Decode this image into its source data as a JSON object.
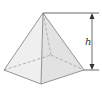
{
  "diagram": {
    "type": "square-pyramid",
    "height_label": "h",
    "colors": {
      "edge": "#8a8a8a",
      "hidden_edge": "#9a9a9a",
      "face_left": "#ececec",
      "face_right": "#dedede",
      "dimension_line": "#444444"
    }
  }
}
